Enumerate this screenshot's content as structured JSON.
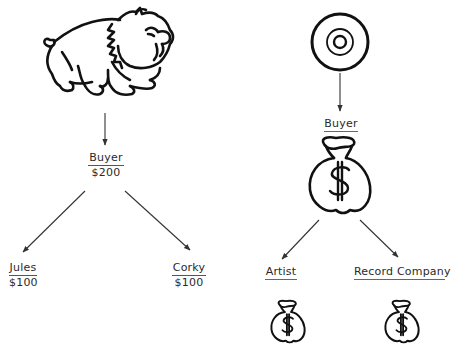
{
  "left_diagram": {
    "source_icon": "bulldog-icon",
    "buyer": {
      "label": "Buyer",
      "amount": "$200"
    },
    "recipients": [
      {
        "label": "Jules",
        "amount": "$100"
      },
      {
        "label": "Corky",
        "amount": "$100"
      }
    ]
  },
  "right_diagram": {
    "source_icon": "record-disc-icon",
    "buyer": {
      "label": "Buyer",
      "icon": "money-bag-icon"
    },
    "recipients": [
      {
        "label": "Artist",
        "icon": "money-bag-icon"
      },
      {
        "label": "Record Company",
        "icon": "money-bag-icon"
      }
    ]
  },
  "colors": {
    "ink": "#1a1a1a",
    "arrow": "#444444",
    "background": "#ffffff"
  }
}
